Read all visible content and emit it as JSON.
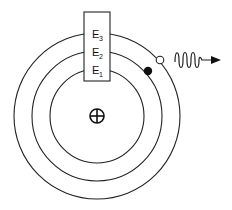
{
  "diagram": {
    "nucleus": {
      "symbol": "plus-in-circle",
      "cx": 97,
      "cy": 116,
      "r": 7
    },
    "orbits": [
      {
        "id": "E1",
        "r": 47
      },
      {
        "id": "E2",
        "r": 65
      },
      {
        "id": "E3",
        "r": 83
      }
    ],
    "energy_box": {
      "x": 84,
      "y": 12,
      "width": 26,
      "height": 69,
      "labels": [
        {
          "main": "E",
          "sub": "3"
        },
        {
          "main": "E",
          "sub": "2"
        },
        {
          "main": "E",
          "sub": "1"
        }
      ]
    },
    "electrons": [
      {
        "state": "filled",
        "cx": 148,
        "cy": 71,
        "orbit": "E2"
      },
      {
        "state": "hollow",
        "cx": 160,
        "cy": 60,
        "orbit": "E3"
      }
    ],
    "photon": {
      "type": "wavy-arrow",
      "start_x": 175,
      "end_x": 220,
      "y": 60
    },
    "colors": {
      "stroke": "#222222",
      "background": "#ffffff"
    }
  }
}
